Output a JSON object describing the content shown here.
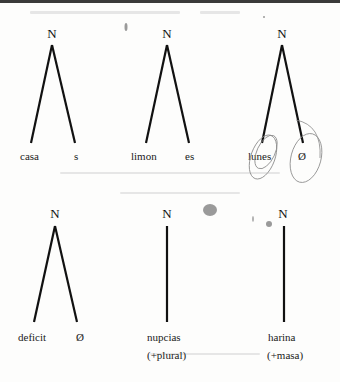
{
  "trees": [
    {
      "node": "N",
      "type": "binary",
      "leaves": [
        "casa",
        "s"
      ]
    },
    {
      "node": "N",
      "type": "binary",
      "leaves": [
        "limon",
        "es"
      ]
    },
    {
      "node": "N",
      "type": "binary",
      "leaves": [
        "lunes",
        "Ø"
      ],
      "annotation": "hand-drawn circles around both leaves"
    },
    {
      "node": "N",
      "type": "binary",
      "leaves": [
        "deficit",
        "Ø"
      ]
    },
    {
      "node": "N",
      "type": "unary",
      "leaves": [
        "nupcias"
      ],
      "note": "(+plural)"
    },
    {
      "node": "N",
      "type": "unary",
      "leaves": [
        "harina"
      ],
      "note": "(+masa)"
    }
  ]
}
